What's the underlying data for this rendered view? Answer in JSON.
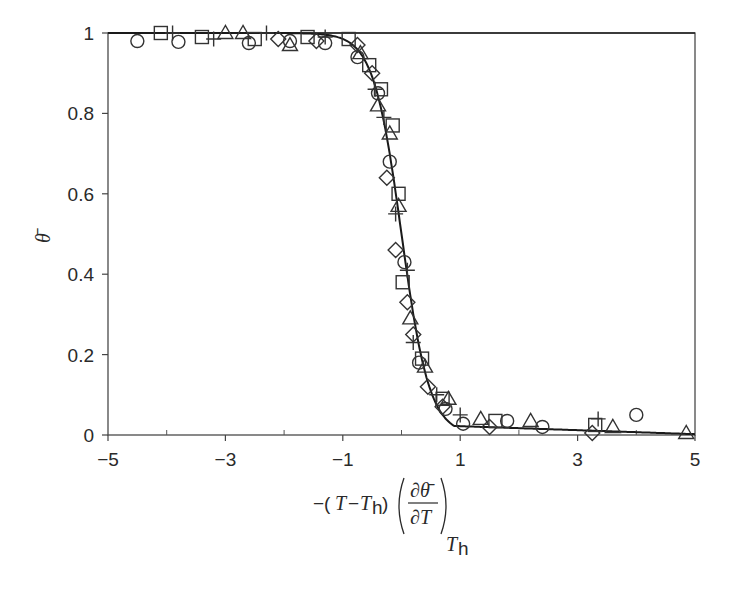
{
  "chart_data": {
    "type": "scatter",
    "title": "",
    "xlabel": "−(T−T_h) (∂θ̄/∂T)_{T_h}",
    "ylabel": "θ̄",
    "xlim": [
      -5,
      5
    ],
    "ylim": [
      0,
      1
    ],
    "x_ticks": [
      -5,
      -3,
      -1,
      1,
      3,
      5
    ],
    "x_tick_labels": [
      "−5",
      "−3",
      "−1",
      "1",
      "3",
      "5"
    ],
    "x_minor_ticks": [
      -4,
      -2,
      0,
      2,
      4
    ],
    "y_ticks": [
      0,
      0.2,
      0.4,
      0.6,
      0.8,
      1
    ],
    "y_tick_labels": [
      "0",
      "0.2",
      "0.4",
      "0.6",
      "0.8",
      "1"
    ],
    "grid": false,
    "legend": "none",
    "fit_curve": {
      "name": "sigmoid fit",
      "description": "θ̄ = 1/(1+exp(4x))",
      "x": [
        -5,
        -4,
        -3,
        -2,
        -1.5,
        -1,
        -0.75,
        -0.5,
        -0.25,
        0,
        0.25,
        0.5,
        0.75,
        1,
        1.5,
        2,
        3,
        4,
        5
      ],
      "y": [
        1.0,
        1.0,
        1.0,
        0.999,
        0.997,
        0.982,
        0.953,
        0.88,
        0.731,
        0.5,
        0.269,
        0.12,
        0.047,
        0.025,
        0.02,
        0.018,
        0.014,
        0.009,
        0.003
      ]
    },
    "series": [
      {
        "name": "circles",
        "marker": "circle",
        "points": [
          [
            -4.5,
            0.98
          ],
          [
            -3.8,
            0.978
          ],
          [
            -2.6,
            0.975
          ],
          [
            -1.9,
            0.98
          ],
          [
            -1.3,
            0.975
          ],
          [
            -0.75,
            0.94
          ],
          [
            -0.4,
            0.85
          ],
          [
            -0.2,
            0.68
          ],
          [
            0.05,
            0.43
          ],
          [
            0.3,
            0.18
          ],
          [
            0.75,
            0.065
          ],
          [
            1.05,
            0.028
          ],
          [
            1.8,
            0.035
          ],
          [
            2.4,
            0.02
          ],
          [
            4.0,
            0.05
          ]
        ]
      },
      {
        "name": "squares",
        "marker": "square",
        "points": [
          [
            -4.1,
            1.0
          ],
          [
            -3.4,
            0.99
          ],
          [
            -2.5,
            0.985
          ],
          [
            -1.6,
            0.99
          ],
          [
            -0.9,
            0.985
          ],
          [
            -0.55,
            0.92
          ],
          [
            -0.35,
            0.86
          ],
          [
            -0.15,
            0.77
          ],
          [
            -0.05,
            0.6
          ],
          [
            0.02,
            0.38
          ],
          [
            0.35,
            0.19
          ],
          [
            0.7,
            0.09
          ],
          [
            1.6,
            0.035
          ],
          [
            3.3,
            0.025
          ]
        ]
      },
      {
        "name": "triangles",
        "marker": "triangle",
        "points": [
          [
            -3.0,
            1.0
          ],
          [
            -2.7,
            1.0
          ],
          [
            -1.9,
            0.97
          ],
          [
            -0.7,
            0.95
          ],
          [
            -0.4,
            0.82
          ],
          [
            -0.2,
            0.75
          ],
          [
            -0.05,
            0.57
          ],
          [
            0.15,
            0.29
          ],
          [
            0.4,
            0.17
          ],
          [
            0.8,
            0.09
          ],
          [
            1.35,
            0.04
          ],
          [
            2.2,
            0.035
          ],
          [
            3.6,
            0.02
          ],
          [
            4.85,
            0.005
          ]
        ]
      },
      {
        "name": "diamonds",
        "marker": "diamond",
        "points": [
          [
            -2.1,
            0.985
          ],
          [
            -1.45,
            0.98
          ],
          [
            -0.75,
            0.97
          ],
          [
            -0.5,
            0.9
          ],
          [
            -0.25,
            0.64
          ],
          [
            -0.1,
            0.46
          ],
          [
            0.1,
            0.33
          ],
          [
            0.2,
            0.25
          ],
          [
            0.45,
            0.12
          ],
          [
            0.7,
            0.07
          ],
          [
            1.5,
            0.02
          ],
          [
            3.25,
            0.005
          ]
        ]
      },
      {
        "name": "crosses",
        "marker": "plus",
        "points": [
          [
            -3.9,
            1.0
          ],
          [
            -3.2,
            0.985
          ],
          [
            -2.3,
            1.0
          ],
          [
            -1.3,
            0.99
          ],
          [
            -0.45,
            0.86
          ],
          [
            -0.3,
            0.79
          ],
          [
            -0.1,
            0.55
          ],
          [
            0.1,
            0.41
          ],
          [
            0.2,
            0.23
          ],
          [
            0.6,
            0.1
          ],
          [
            1.0,
            0.05
          ],
          [
            3.35,
            0.04
          ]
        ]
      }
    ]
  }
}
